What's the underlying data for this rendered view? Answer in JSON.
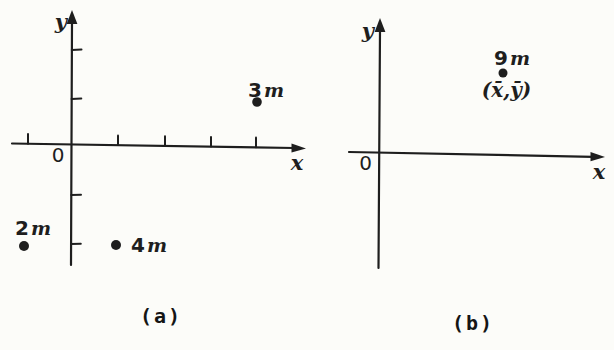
{
  "figure": {
    "ink_color": "#1e1e1e",
    "background_color": "#fcfcf9",
    "panels": [
      {
        "caption": "(a)",
        "y_axis_label": "y",
        "x_axis_label": "x",
        "origin_label": "0",
        "points": [
          {
            "mass": "3",
            "unit": "m",
            "position_units": {
              "x": 4,
              "y": 1
            }
          },
          {
            "mass": "2",
            "unit": "m",
            "position_units": {
              "x": -1,
              "y": -2
            }
          },
          {
            "mass": "4",
            "unit": "m",
            "position_units": {
              "x": 1,
              "y": -2
            }
          }
        ]
      },
      {
        "caption": "(b)",
        "y_axis_label": "y",
        "x_axis_label": "x",
        "origin_label": "0",
        "points": [
          {
            "mass": "9",
            "unit": "m",
            "coord_label": "(x̄,ȳ)"
          }
        ]
      }
    ]
  }
}
